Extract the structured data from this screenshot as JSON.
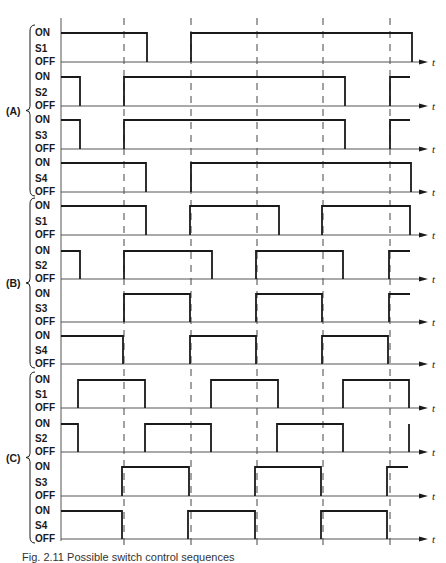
{
  "figure": {
    "caption": "Fig. 2.11 Possible switch control sequences",
    "time_label": "t",
    "level_labels": {
      "on": "ON",
      "off": "OFF"
    },
    "colors": {
      "line": "#1a1a1a",
      "axis": "#555555",
      "dash": "#444444",
      "background": "#ffffff"
    },
    "axis_x": 61,
    "axis_end_x": 428,
    "dashed_lines_x": [
      124,
      191,
      257,
      323,
      390
    ],
    "dashed_top_y": 18,
    "dashed_bottom_y": 545
  },
  "sections": [
    {
      "label": "(A)",
      "signals": [
        {
          "name": "S1",
          "on_y": 33,
          "off_y": 62,
          "pulses": [
            [
              61,
              147
            ],
            [
              191,
              412
            ]
          ]
        },
        {
          "name": "S2",
          "on_y": 77,
          "off_y": 106,
          "pulses": [
            [
              61,
              80
            ],
            [
              124,
              213
            ],
            [
              124,
              345
            ],
            [
              390,
              410
            ]
          ]
        },
        {
          "name": "S3",
          "on_y": 120,
          "off_y": 149,
          "pulses": [
            [
              61,
              80
            ],
            [
              124,
              345
            ],
            [
              390,
              410
            ]
          ]
        },
        {
          "name": "S4",
          "on_y": 163,
          "off_y": 192,
          "pulses": [
            [
              61,
              146
            ],
            [
              191,
              411
            ]
          ]
        }
      ]
    },
    {
      "label": "(B)",
      "signals": [
        {
          "name": "S1",
          "on_y": 206,
          "off_y": 235,
          "pulses": [
            [
              61,
              146
            ],
            [
              190,
              279
            ],
            [
              322,
              410
            ]
          ]
        },
        {
          "name": "S2",
          "on_y": 251,
          "off_y": 279,
          "pulses": [
            [
              61,
              80
            ],
            [
              124,
              212
            ],
            [
              256,
              343
            ],
            [
              389,
              410
            ]
          ]
        },
        {
          "name": "S3",
          "on_y": 294,
          "off_y": 322,
          "pulses": [
            [
              124,
              190
            ],
            [
              256,
              322
            ],
            [
              389,
              410
            ]
          ]
        },
        {
          "name": "S4",
          "on_y": 336,
          "off_y": 364,
          "pulses": [
            [
              61,
              123
            ],
            [
              190,
              256
            ],
            [
              322,
              388
            ]
          ]
        }
      ]
    },
    {
      "label": "(C)",
      "signals": [
        {
          "name": "S1",
          "on_y": 380,
          "off_y": 408,
          "pulses": [
            [
              78,
              145
            ],
            [
              211,
              278
            ],
            [
              343,
              409
            ]
          ]
        },
        {
          "name": "S2",
          "on_y": 424,
          "off_y": 452,
          "pulses": [
            [
              61,
              78
            ],
            [
              145,
              211
            ],
            [
              277,
              343
            ],
            [
              409,
              409
            ]
          ]
        },
        {
          "name": "S3",
          "on_y": 467,
          "off_y": 496,
          "pulses": [
            [
              122,
              189
            ],
            [
              255,
              321
            ],
            [
              387,
              408
            ]
          ]
        },
        {
          "name": "S4",
          "on_y": 511,
          "off_y": 539,
          "pulses": [
            [
              61,
              122
            ],
            [
              188,
              255
            ],
            [
              321,
              387
            ]
          ]
        }
      ]
    }
  ]
}
